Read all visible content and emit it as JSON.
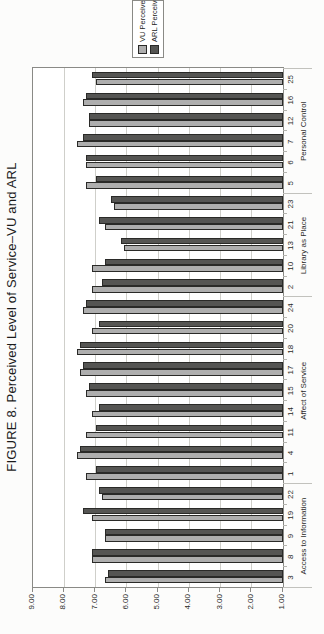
{
  "figure": {
    "title": "FIGURE 8. Perceived Level of Service–VU and ARL"
  },
  "chart_data": {
    "type": "bar",
    "orientation": "column-chart-rotated-90ccw-on-page",
    "title": "FIGURE 8. Perceived Level of Service–VU and ARL",
    "value_axis": {
      "min": 1.0,
      "max": 9.0,
      "step": 1.0,
      "tick_labels": [
        "1.00",
        "2.00",
        "3.00",
        "4.00",
        "5.00",
        "6.00",
        "7.00",
        "8.00",
        "9.00"
      ],
      "grid": true
    },
    "category_axis": {
      "groups": [
        {
          "label": "Access to Information",
          "categories": [
            "3",
            "8",
            "9",
            "19",
            "22"
          ]
        },
        {
          "label": "Affect of Service",
          "categories": [
            "1",
            "4",
            "11",
            "14",
            "15",
            "17",
            "18",
            "20",
            "24"
          ]
        },
        {
          "label": "Library as Place",
          "categories": [
            "2",
            "10",
            "13",
            "21",
            "23"
          ]
        },
        {
          "label": "Personal Control",
          "categories": [
            "5",
            "6",
            "7",
            "12",
            "16",
            "25"
          ]
        }
      ]
    },
    "categories": [
      "3",
      "8",
      "9",
      "19",
      "22",
      "1",
      "4",
      "11",
      "14",
      "15",
      "17",
      "18",
      "20",
      "24",
      "2",
      "10",
      "13",
      "21",
      "23",
      "5",
      "6",
      "7",
      "12",
      "16",
      "25"
    ],
    "series": [
      {
        "name": "VU Perceived",
        "color": "#aeaeae",
        "values": [
          6.7,
          7.1,
          6.7,
          7.1,
          6.8,
          7.3,
          7.6,
          7.3,
          7.1,
          7.3,
          7.5,
          7.6,
          7.1,
          7.4,
          7.1,
          7.1,
          6.1,
          6.7,
          6.4,
          7.3,
          7.3,
          7.6,
          7.2,
          7.4,
          7.0
        ]
      },
      {
        "name": "ARL Perceived",
        "color": "#555553",
        "values": [
          6.6,
          7.1,
          6.7,
          7.4,
          6.9,
          7.0,
          7.5,
          7.0,
          6.9,
          7.2,
          7.4,
          7.5,
          6.9,
          7.3,
          6.8,
          6.7,
          6.2,
          6.9,
          6.5,
          7.0,
          7.3,
          7.4,
          7.2,
          7.3,
          7.1
        ]
      }
    ],
    "legend": {
      "position": "right",
      "entries": [
        "VU Perceived",
        "ARL Perceived"
      ]
    }
  }
}
